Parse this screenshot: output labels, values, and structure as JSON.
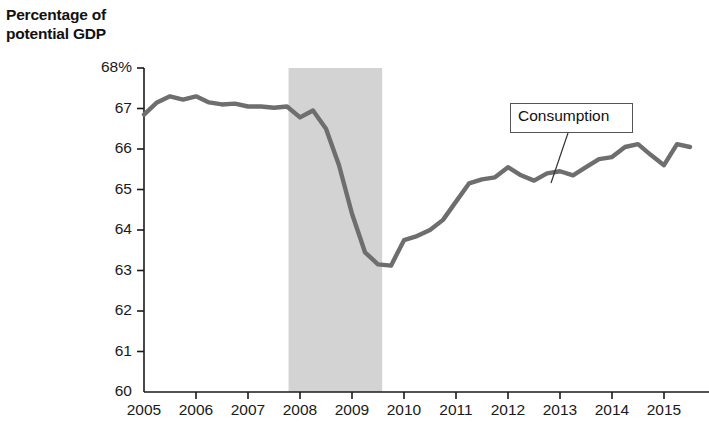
{
  "chart_data": {
    "type": "line",
    "title": "Percentage of\npotential GDP",
    "ylabel": "Percentage of potential GDP",
    "xlabel": "",
    "ylim": [
      60,
      68
    ],
    "ytick_labels": [
      "68%",
      "67",
      "66",
      "65",
      "64",
      "63",
      "62",
      "61",
      "60"
    ],
    "ytick_values": [
      68,
      67,
      66,
      65,
      64,
      63,
      62,
      61,
      60
    ],
    "xlim": [
      2005,
      2015.75
    ],
    "categories": [
      "2005",
      "2006",
      "2007",
      "2008",
      "2009",
      "2010",
      "2011",
      "2012",
      "2013",
      "2014",
      "2015"
    ],
    "xtick_values": [
      2005,
      2006,
      2007,
      2008,
      2009,
      2010,
      2011,
      2012,
      2013,
      2014,
      2015
    ],
    "grid": false,
    "legend": "none",
    "series": [
      {
        "name": "Consumption",
        "color": "#6e6e6e",
        "x": [
          2005.0,
          2005.25,
          2005.5,
          2005.75,
          2006.0,
          2006.25,
          2006.5,
          2006.75,
          2007.0,
          2007.25,
          2007.5,
          2007.75,
          2008.0,
          2008.25,
          2008.5,
          2008.75,
          2009.0,
          2009.25,
          2009.5,
          2009.75,
          2010.0,
          2010.25,
          2010.5,
          2010.75,
          2011.0,
          2011.25,
          2011.5,
          2011.75,
          2012.0,
          2012.25,
          2012.5,
          2012.75,
          2013.0,
          2013.25,
          2013.5,
          2013.75,
          2014.0,
          2014.25,
          2014.5,
          2014.75,
          2015.0,
          2015.25,
          2015.5
        ],
        "values": [
          66.85,
          67.15,
          67.3,
          67.22,
          67.3,
          67.15,
          67.1,
          67.12,
          67.05,
          67.05,
          67.02,
          67.05,
          66.78,
          66.95,
          66.5,
          65.6,
          64.4,
          63.45,
          63.15,
          63.12,
          63.75,
          63.85,
          64.0,
          64.25,
          64.7,
          65.15,
          65.25,
          65.3,
          65.55,
          65.35,
          65.22,
          65.4,
          65.45,
          65.35,
          65.55,
          65.75,
          65.8,
          66.05,
          66.12,
          65.85,
          65.6,
          66.12,
          66.05
        ]
      }
    ],
    "annotations": [
      {
        "label": "Consumption",
        "box": {
          "x": 510,
          "y": 103,
          "width": 123,
          "height": 30
        },
        "leader_from": {
          "x": 568,
          "y": 133
        },
        "leader_to": {
          "x": 551,
          "y": 183
        }
      }
    ],
    "shaded_regions": [
      {
        "name": "recession-band",
        "x_start": 2007.78,
        "x_end": 2009.58,
        "color": "#d3d3d3"
      }
    ],
    "axis_color": "#1a1a1a",
    "line_color": "#6e6e6e",
    "background": "#ffffff"
  }
}
